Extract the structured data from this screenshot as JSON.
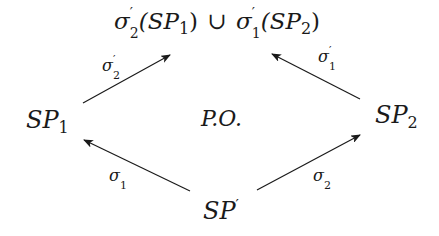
{
  "diagram": {
    "type": "pushout-commutative-diagram",
    "nodes": {
      "top": {
        "text": "σ′₂(SP₁) ∪ σ′₁(SP₂)",
        "part1_sym": "σ",
        "part1_prime": "′",
        "part1_sub": "2",
        "part1_arg": "(SP",
        "part1_arg_sub": "1",
        "part1_close": ")",
        "union": "∪",
        "part2_sym": "σ",
        "part2_prime": "′",
        "part2_sub": "1",
        "part2_arg": "(SP",
        "part2_arg_sub": "2",
        "part2_close": ")"
      },
      "left": {
        "text": "SP₁",
        "base": "SP",
        "sub": "1"
      },
      "right": {
        "text": "SP₂",
        "base": "SP",
        "sub": "2"
      },
      "bottom": {
        "text": "SP′",
        "base": "SP",
        "prime": "′"
      },
      "center": {
        "text": "P.O."
      }
    },
    "edges": [
      {
        "name": "sigma2-prime",
        "from": "left",
        "to": "top",
        "label_sym": "σ",
        "label_prime": "′",
        "label_sub": "2",
        "x1": 83,
        "y1": 103,
        "x2": 170,
        "y2": 55
      },
      {
        "name": "sigma1-prime",
        "from": "right",
        "to": "top",
        "label_sym": "σ",
        "label_prime": "′",
        "label_sub": "1",
        "x1": 360,
        "y1": 99,
        "x2": 272,
        "y2": 54
      },
      {
        "name": "sigma1",
        "from": "bottom",
        "to": "left",
        "label_sym": "σ",
        "label_sub": "1",
        "x1": 190,
        "y1": 191,
        "x2": 84,
        "y2": 140
      },
      {
        "name": "sigma2",
        "from": "bottom",
        "to": "right",
        "label_sym": "σ",
        "label_sub": "2",
        "x1": 257,
        "y1": 190,
        "x2": 360,
        "y2": 135
      }
    ],
    "colors": {
      "ink": "#1a1a1a",
      "background": "#ffffff"
    }
  }
}
